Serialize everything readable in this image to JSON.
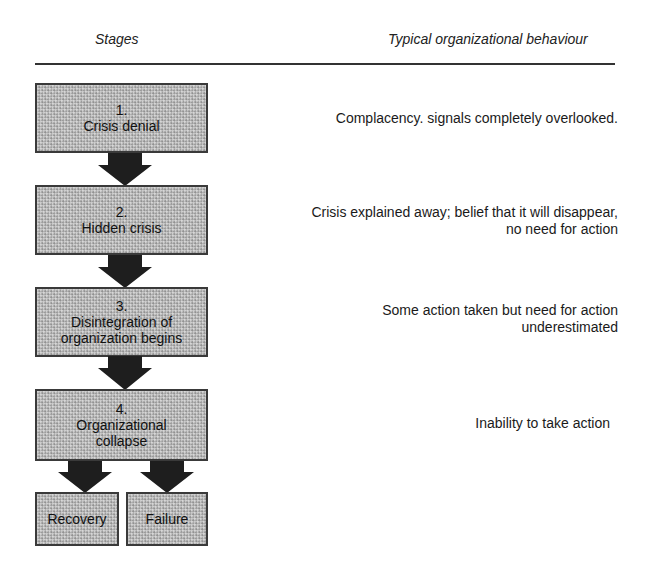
{
  "header": {
    "left_title": "Stages",
    "right_title": "Typical organizational behaviour"
  },
  "stages": [
    {
      "number": "1.",
      "label_line1": "Crisis denial",
      "label_line2": "",
      "behaviour_line1": "Complacency. signals completely overlooked.",
      "behaviour_line2": ""
    },
    {
      "number": "2.",
      "label_line1": "Hidden crisis",
      "label_line2": "",
      "behaviour_line1": "Crisis explained away; belief that it will disappear,",
      "behaviour_line2": "no need for action"
    },
    {
      "number": "3.",
      "label_line1": "Disintegration of",
      "label_line2": "organization begins",
      "behaviour_line1": "Some action taken but need for action",
      "behaviour_line2": "underestimated"
    },
    {
      "number": "4.",
      "label_line1": "Organizational",
      "label_line2": "collapse",
      "behaviour_line1": "Inability to take action",
      "behaviour_line2": ""
    }
  ],
  "outcomes": [
    {
      "label": "Recovery"
    },
    {
      "label": "Failure"
    }
  ],
  "colors": {
    "box_fill": "#bcbcbc",
    "box_border": "#3a3a3a",
    "arrow": "#1e1e1e",
    "rule": "#333333"
  }
}
